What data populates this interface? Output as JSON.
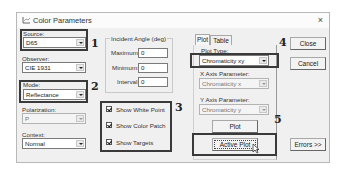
{
  "window": {
    "title": "Color Parameters",
    "close_glyph": "×"
  },
  "left": {
    "source": {
      "label": "Source:",
      "value": "D65"
    },
    "observer": {
      "label": "Observer:",
      "value": "CIE 1931"
    },
    "mode": {
      "label": "Mode:",
      "value": "Reflectance"
    },
    "polarization": {
      "label": "Polarization:",
      "value": "P"
    },
    "context": {
      "label": "Context:",
      "value": "Normal"
    }
  },
  "incident_angle": {
    "title": "Incident Angle (deg)",
    "maximum": {
      "label": "Maximum:",
      "value": "0"
    },
    "minimum": {
      "label": "Minimum:",
      "value": "0"
    },
    "interval": {
      "label": "Interval:",
      "value": "0"
    }
  },
  "checkboxes": [
    {
      "label": "Show White Point",
      "checked": true
    },
    {
      "label": "Show Color Patch",
      "checked": true
    },
    {
      "label": "Show Targets",
      "checked": true
    }
  ],
  "tabs": [
    {
      "label": "Plot",
      "active": true
    },
    {
      "label": "Table",
      "active": false
    }
  ],
  "plot_panel": {
    "plot_type": {
      "label": "Plot Type:",
      "value": "Chromaticity xy"
    },
    "x_axis": {
      "label": "X Axis Parameter:",
      "value": "Chromaticity x"
    },
    "y_axis": {
      "label": "Y Axis Parameter:",
      "value": "Chromaticity y"
    },
    "plot_button": "Plot",
    "active_plot_button": "Active Plot"
  },
  "buttons": {
    "close": "Close",
    "cancel": "Cancel",
    "errors": "Errors >>"
  },
  "annotations": [
    "1",
    "2",
    "3",
    "4",
    "5"
  ]
}
